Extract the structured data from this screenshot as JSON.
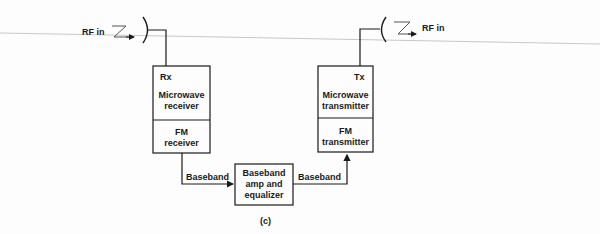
{
  "diagram": {
    "left_antenna": {
      "label": "RF in"
    },
    "right_antenna": {
      "label": "RF in"
    },
    "receiver_block": {
      "tag": "Rx",
      "upper_label_line1": "Microwave",
      "upper_label_line2": "receiver",
      "lower_label_line1": "FM",
      "lower_label_line2": "receiver"
    },
    "transmitter_block": {
      "tag": "Tx",
      "upper_label_line1": "Microwave",
      "upper_label_line2": "transmitter",
      "lower_label_line1": "FM",
      "lower_label_line2": "transmitter"
    },
    "amp_block": {
      "line1": "Baseband",
      "line2": "amp and",
      "line3": "equalizer"
    },
    "signal_left": "Baseband",
    "signal_right": "Baseband",
    "caption": "(c)"
  }
}
